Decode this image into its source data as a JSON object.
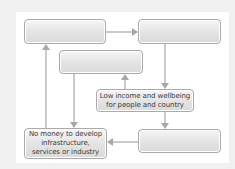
{
  "diagram": {
    "type": "cycle-flowchart",
    "colors": {
      "frame_background": "#f1f1f1",
      "panel_background": "#ffffff",
      "box_border": "#a9a9a9",
      "box_fill_top": "#f6f6f6",
      "box_fill_bottom": "#dadada",
      "arrow": "#a8a8a8",
      "text": "#3a3a3a"
    },
    "boxes": {
      "top_left": {
        "label": ""
      },
      "top_right": {
        "label": ""
      },
      "middle": {
        "label": ""
      },
      "low_income": {
        "label": "Low income and wellbeing for people and country"
      },
      "bottom_right": {
        "label": ""
      },
      "bottom_left": {
        "label": "No money to develop infrastructure, services or industry"
      }
    },
    "edges": [
      {
        "from": "top_left",
        "to": "top_right",
        "direction": "right"
      },
      {
        "from": "top_right",
        "to": "low_income",
        "direction": "down"
      },
      {
        "from": "low_income",
        "to": "middle",
        "direction": "up"
      },
      {
        "from": "low_income",
        "to": "bottom_right",
        "direction": "down"
      },
      {
        "from": "bottom_right",
        "to": "bottom_left",
        "direction": "left"
      },
      {
        "from": "middle",
        "to": "bottom_left",
        "direction": "down"
      },
      {
        "from": "bottom_left",
        "to": "top_left",
        "direction": "up"
      }
    ]
  }
}
